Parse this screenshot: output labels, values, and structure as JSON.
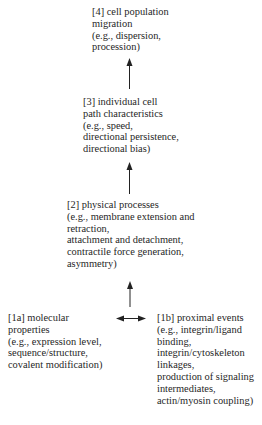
{
  "diagram": {
    "nodes": [
      {
        "id": "level4",
        "lines": [
          "[4] cell population",
          "migration",
          "(e.g., dispersion,",
          "procession)"
        ]
      },
      {
        "id": "level3",
        "lines": [
          "[3] individual cell",
          "path characteristics",
          "(e.g., speed,",
          "directional persistence,",
          "directional bias)"
        ]
      },
      {
        "id": "level2",
        "lines": [
          "[2] physical processes",
          "(e.g., membrane extension and",
          "retraction,",
          "attachment and detachment,",
          "contractile force generation,",
          "asymmetry)"
        ]
      },
      {
        "id": "level1a",
        "lines": [
          "[1a] molecular",
          "properties",
          "(e.g., expression level,",
          "sequence/structure,",
          "covalent modification)"
        ]
      },
      {
        "id": "level1b",
        "lines": [
          "[1b] proximal events",
          "(e.g., integrin/ligand",
          "binding,",
          "integrin/cytoskeleton",
          "linkages,",
          "production of signaling",
          "intermediates,",
          "actin/myosin coupling)"
        ]
      }
    ],
    "edges": [
      {
        "from": "level3",
        "to": "level4",
        "type": "up-arrow"
      },
      {
        "from": "level2",
        "to": "level3",
        "type": "up-arrow"
      },
      {
        "from": "level1",
        "to": "level2",
        "type": "up-arrow"
      },
      {
        "from": "level1a",
        "to": "level1b",
        "type": "bidirectional-arrow"
      }
    ],
    "colors": {
      "text": "#1f1f1f",
      "arrow": "#222222",
      "background": "#ffffff"
    }
  }
}
